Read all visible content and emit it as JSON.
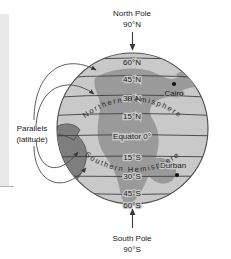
{
  "figure": {
    "type": "globe-latitude-diagram",
    "poles": {
      "north": {
        "name": "North Pole",
        "value": "90°N"
      },
      "south": {
        "name": "South Pole",
        "value": "90°S"
      }
    },
    "hemispheres": {
      "north": "Northern Hemisphere",
      "south": "Southern Hemisphere"
    },
    "callout": {
      "line1": "Parallels",
      "line2": "(latitude)"
    },
    "parallels": [
      {
        "label": "60°N",
        "deg": 60
      },
      {
        "label": "45°N",
        "deg": 45
      },
      {
        "label": "30°N",
        "deg": 30
      },
      {
        "label": "15°N",
        "deg": 15
      },
      {
        "label": "Equator 0°",
        "deg": 0
      },
      {
        "label": "15°S",
        "deg": -15
      },
      {
        "label": "30°S",
        "deg": -30
      },
      {
        "label": "45°S",
        "deg": -45
      },
      {
        "label": "60°S",
        "deg": -60
      }
    ],
    "cities": [
      {
        "name": "Cairo",
        "dot": "above-label"
      },
      {
        "name": "Durban",
        "dot": "below-label"
      }
    ],
    "colors": {
      "ocean": "#c9c9c9",
      "land": "#9a9a9a",
      "land_dark": "#7e7e7e",
      "outline": "#4a4a4a",
      "text": "#1a1a1a",
      "background": "#ffffff",
      "edge_strip": "#e9e9e9"
    }
  }
}
